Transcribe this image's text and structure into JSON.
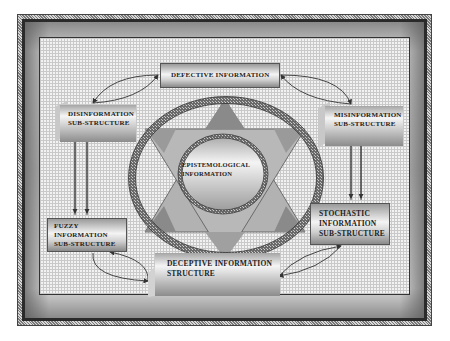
{
  "diagram": {
    "nodes": {
      "defective": {
        "label": "DEFECTIVE INFORMATION"
      },
      "disinformation": {
        "line1": "DISINFORMATION",
        "line2": "SUB-STRUCTURE"
      },
      "misinformation": {
        "line1": "MISINFORMATION",
        "line2": "SUB-STRUCTURE"
      },
      "fuzzy": {
        "line1": "FUZZY",
        "line2": "INFORMATION",
        "line3": "SUB-STRUCTURE"
      },
      "stochastic": {
        "line1": "STOCHASTIC",
        "line2": "INFORMATION",
        "line3": "SUB-STRUCTURE"
      },
      "deceptive": {
        "line1": "DECEPTIVE INFORMATION",
        "line2": "STRUCTURE"
      },
      "epistemological": {
        "line1": "EPISTEMOLOGICAL",
        "line2": "INFORMATION"
      }
    },
    "edges": [
      {
        "from": "defective",
        "to": "disinformation",
        "type": "bidirectional-curve"
      },
      {
        "from": "defective",
        "to": "misinformation",
        "type": "bidirectional-curve"
      },
      {
        "from": "disinformation",
        "to": "fuzzy",
        "type": "double-arrow"
      },
      {
        "from": "misinformation",
        "to": "stochastic",
        "type": "double-arrow"
      },
      {
        "from": "fuzzy",
        "to": "deceptive",
        "type": "bidirectional-curve"
      },
      {
        "from": "stochastic",
        "to": "deceptive",
        "type": "bidirectional-curve"
      }
    ],
    "colors": {
      "grid_background": "#f2f2f2",
      "grid_lines": "#c9c9c9",
      "triangle_light": "#b4b4b4",
      "triangle_dark": "#8c8c8c",
      "ring": "#555555",
      "arrow": "#333333"
    }
  }
}
